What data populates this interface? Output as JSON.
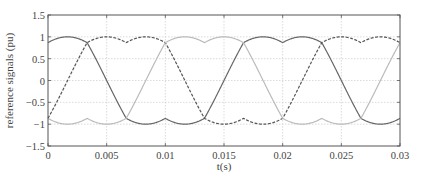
{
  "chart_data": {
    "type": "line",
    "title": "",
    "xlabel": "t(s)",
    "ylabel": "reference signals (pu)",
    "xlim": [
      0,
      0.03
    ],
    "ylim": [
      -1.5,
      1.5
    ],
    "xticks": [
      "0",
      "0.005",
      "0.01",
      "0.015",
      "0.02",
      "0.025",
      "0.03"
    ],
    "yticks": [
      "1.5",
      "1",
      "0.5",
      "0",
      "-0.5",
      "-1",
      "-1.5"
    ],
    "grid": true,
    "legend": null,
    "series": [
      {
        "name": "phase-a (solid dark)",
        "style": "solid",
        "color": "#666666",
        "phase_deg": 90
      },
      {
        "name": "phase-b (dashed dark)",
        "style": "dashed",
        "color": "#555555",
        "phase_deg": -30
      },
      {
        "name": "phase-c (solid light)",
        "style": "solid",
        "color": "#bbbbbb",
        "phase_deg": 210
      }
    ],
    "frequency_hz": 50
  }
}
